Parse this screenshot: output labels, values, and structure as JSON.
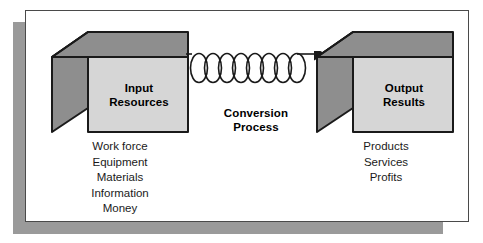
{
  "diagram": {
    "colors": {
      "panel_background": "#ffffff",
      "panel_border": "#4a4a4a",
      "shadow": "#9a9a9a",
      "cube_front_face": "#d6d6d6",
      "cube_side_face": "#8e8e8e",
      "cube_top_face": "#8e8e8e",
      "cube_outline": "#1a1a1a",
      "text": "#000000",
      "spring": "#1a1a1a"
    },
    "input_box": {
      "label_line1": "Input",
      "label_line2": "Resources",
      "items": [
        "Work force",
        "Equipment",
        "Materials",
        "Information",
        "Money"
      ]
    },
    "conversion": {
      "label_line1": "Conversion",
      "label_line2": "Process",
      "spring_coils": 8,
      "arrow_direction": "right"
    },
    "output_box": {
      "label_line1": "Output",
      "label_line2": "Results",
      "items": [
        "Products",
        "Services",
        "Profits"
      ]
    }
  }
}
